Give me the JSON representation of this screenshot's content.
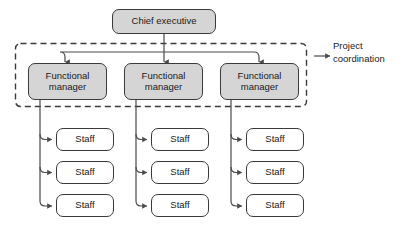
{
  "diagram": {
    "type": "organizational-chart",
    "title_node": {
      "id": "chief-executive",
      "label": "Chief executive",
      "fill": "#d5d5d5",
      "x": 112,
      "y": 9,
      "w": 104,
      "h": 25
    },
    "boundary": {
      "name": "project-coordination-boundary",
      "style": "dashed",
      "x": 15,
      "y": 43,
      "w": 292,
      "h": 64
    },
    "annotation": {
      "label": "Project\ncoordination",
      "line1": "Project",
      "line2": "coordination",
      "x": 333,
      "y": 40,
      "arrow_from_x": 330,
      "arrow_to_x": 308,
      "arrow_y": 56
    },
    "managers": [
      {
        "id": "functional-manager-1",
        "label": "Functional\nmanager",
        "fill": "#d5d5d5",
        "x": 28,
        "y": 63,
        "w": 79,
        "h": 37
      },
      {
        "id": "functional-manager-2",
        "label": "Functional\nmanager",
        "fill": "#d5d5d5",
        "x": 124,
        "y": 63,
        "w": 79,
        "h": 37
      },
      {
        "id": "functional-manager-3",
        "label": "Functional\nmanager",
        "fill": "#d5d5d5",
        "x": 220,
        "y": 63,
        "w": 79,
        "h": 37
      }
    ],
    "staff_columns": [
      {
        "column": 1,
        "parent": "functional-manager-1",
        "drop_line_x": 40,
        "box_x": 56,
        "box_w": 58,
        "boxes": [
          {
            "id": "staff-1-1",
            "label": "Staff",
            "fill": "#ffffff",
            "y": 128,
            "h": 23
          },
          {
            "id": "staff-1-2",
            "label": "Staff",
            "fill": "#ffffff",
            "y": 161,
            "h": 23
          },
          {
            "id": "staff-1-3",
            "label": "Staff",
            "fill": "#ffffff",
            "y": 194,
            "h": 23
          }
        ]
      },
      {
        "column": 2,
        "parent": "functional-manager-2",
        "drop_line_x": 136,
        "box_x": 151,
        "box_w": 58,
        "boxes": [
          {
            "id": "staff-2-1",
            "label": "Staff",
            "fill": "#ffffff",
            "y": 128,
            "h": 23
          },
          {
            "id": "staff-2-2",
            "label": "Staff",
            "fill": "#ffffff",
            "y": 161,
            "h": 23
          },
          {
            "id": "staff-2-3",
            "label": "Staff",
            "fill": "#ffffff",
            "y": 194,
            "h": 23
          }
        ]
      },
      {
        "column": 3,
        "parent": "functional-manager-3",
        "drop_line_x": 231,
        "box_x": 246,
        "box_w": 58,
        "boxes": [
          {
            "id": "staff-3-1",
            "label": "Staff",
            "fill": "#ffffff",
            "y": 128,
            "h": 23
          },
          {
            "id": "staff-3-2",
            "label": "Staff",
            "fill": "#ffffff",
            "y": 161,
            "h": 23
          },
          {
            "id": "staff-3-3",
            "label": "Staff",
            "fill": "#ffffff",
            "y": 194,
            "h": 23
          }
        ]
      }
    ],
    "connectors": {
      "exec_stem_x": 164,
      "exec_stem_top": 34,
      "bus_y": 52,
      "bus_left_x": 65,
      "bus_right_x": 259,
      "arrow_targets_x": [
        65,
        164,
        259
      ],
      "arrow_tip_y": 62
    },
    "colors": {
      "stroke": "#3a3a3a",
      "connector": "#4a4a4a",
      "fill_gray": "#d5d5d5",
      "fill_white": "#ffffff",
      "text": "#1a1a1a",
      "background": "#ffffff"
    }
  }
}
